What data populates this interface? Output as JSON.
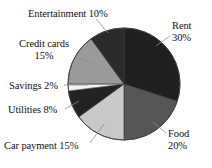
{
  "chart_data": {
    "type": "pie",
    "title": "",
    "xlabel": "",
    "ylabel": "",
    "legend_position": "none",
    "grid": false,
    "start_angle_deg": 0,
    "direction": "clockwise",
    "categories": [
      "Rent",
      "Food",
      "Car payment",
      "Utilities",
      "Savings",
      "Credit cards",
      "Entertainment"
    ],
    "values": [
      30,
      20,
      15,
      8,
      2,
      15,
      10
    ],
    "unit": "%",
    "total": 100,
    "slices": [
      {
        "name": "Rent",
        "label_line1": "Rent",
        "label_line2": "30%",
        "label_text": "Rent 30%",
        "value": 30,
        "color": "#1f1f1f",
        "start_deg": 0,
        "end_deg": 108
      },
      {
        "name": "Food",
        "label_line1": "Food",
        "label_line2": "20%",
        "label_text": "Food 20%",
        "value": 20,
        "color": "#565656",
        "start_deg": 108,
        "end_deg": 180
      },
      {
        "name": "Car payment",
        "label_line1": "Car payment 15%",
        "label_line2": "",
        "label_text": "Car payment 15%",
        "value": 15,
        "color": "#c9c9c9",
        "start_deg": 180,
        "end_deg": 234
      },
      {
        "name": "Utilities",
        "label_line1": "Utilities 8%",
        "label_line2": "",
        "label_text": "Utilities 8%",
        "value": 8,
        "color": "#232323",
        "start_deg": 234,
        "end_deg": 262.8
      },
      {
        "name": "Savings",
        "label_line1": "Savings 2%",
        "label_line2": "",
        "label_text": "Savings 2%",
        "value": 2,
        "color": "#f2f2f2",
        "start_deg": 262.8,
        "end_deg": 270
      },
      {
        "name": "Credit cards",
        "label_line1": "Credit cards",
        "label_line2": "15%",
        "label_text": "Credit cards 15%",
        "value": 15,
        "color": "#9a9a9a",
        "start_deg": 270,
        "end_deg": 324
      },
      {
        "name": "Entertainment",
        "label_line1": "Entertainment 10%",
        "label_line2": "",
        "label_text": "Entertainment 10%",
        "value": 10,
        "color": "#2b2b2b",
        "start_deg": 324,
        "end_deg": 360
      }
    ]
  },
  "colors": {
    "background": "#ffffff",
    "text": "#111111",
    "outline": "#3a3a3a",
    "leader_line": "#8e8e8e"
  }
}
